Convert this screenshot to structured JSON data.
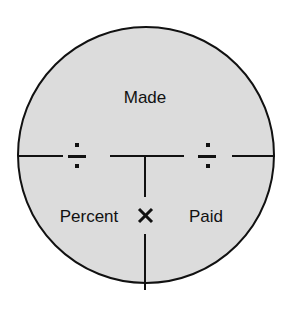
{
  "diagram": {
    "type": "formula-circle",
    "colors": {
      "fill": "#dcdcdc",
      "stroke": "#111111"
    },
    "top": {
      "label": "Made"
    },
    "bottom_left": {
      "label": "Percent"
    },
    "bottom_right": {
      "label": "Paid"
    },
    "operators": {
      "divide_left": "÷",
      "divide_right": "÷",
      "multiply": "×"
    }
  }
}
